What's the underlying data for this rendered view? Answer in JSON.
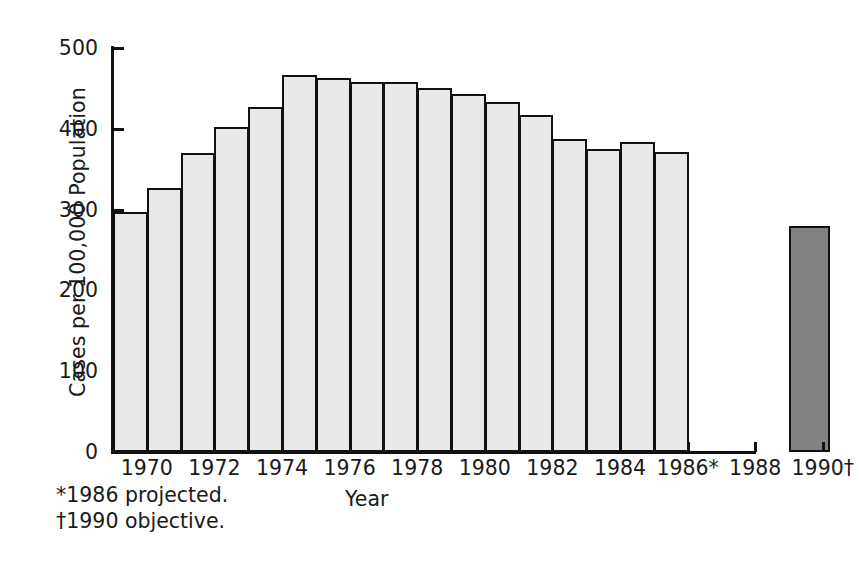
{
  "chart_data": {
    "type": "bar",
    "title": "",
    "xlabel": "Year",
    "ylabel": "Cases per 100,000 Population",
    "ylim": [
      0,
      500
    ],
    "ytick_values": [
      0,
      100,
      200,
      300,
      400,
      500
    ],
    "ytick_labels": [
      "0",
      "100",
      "200",
      "300",
      "400",
      "500"
    ],
    "grid": false,
    "legend": "none",
    "categories": [
      "1970",
      "1971",
      "1972",
      "1973",
      "1974",
      "1975",
      "1976",
      "1977",
      "1978",
      "1979",
      "1980",
      "1981",
      "1982",
      "1983",
      "1984",
      "1985",
      "1986",
      "1990"
    ],
    "values": [
      297,
      327,
      370,
      402,
      427,
      467,
      463,
      458,
      458,
      450,
      443,
      433,
      417,
      387,
      375,
      384,
      371,
      280
    ],
    "bar_styles": [
      "light",
      "light",
      "light",
      "light",
      "light",
      "light",
      "light",
      "light",
      "light",
      "light",
      "light",
      "light",
      "light",
      "light",
      "light",
      "light",
      "light",
      "dark"
    ],
    "xtick_labels": [
      "1970",
      "1972",
      "1974",
      "1976",
      "1978",
      "1980",
      "1982",
      "1984",
      "1986*",
      "1988",
      "1990†"
    ],
    "xtick_categories": [
      "1970",
      "1972",
      "1974",
      "1976",
      "1978",
      "1980",
      "1982",
      "1984",
      "1986",
      "1988",
      "1990"
    ],
    "colors": {
      "light_bar_fill": "#e9e9e9",
      "dark_bar_fill": "#828282",
      "bar_border": "#111111",
      "axis": "#111111",
      "text": "#1a1a1a",
      "background": "#ffffff"
    },
    "annotations": [
      "*1986 projected.",
      "†1990 objective."
    ]
  },
  "footnotes": {
    "line1": "*1986 projected.",
    "line2": "†1990 objective."
  }
}
